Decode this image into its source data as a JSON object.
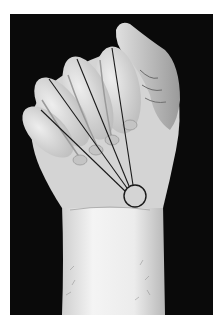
{
  "image": {
    "subject": "clenched fist with lines converging on wrist",
    "style": "black-and-white photograph",
    "background_color": "#0a0a0a",
    "page_color": "#ffffff",
    "skin_color": "#d8d8d8",
    "line_color": "#1a1a1a"
  },
  "annotations": {
    "lines": [
      {
        "name": "little-finger-line",
        "x1": 41,
        "y1": 110,
        "x2": 125,
        "y2": 191
      },
      {
        "name": "ring-finger-line",
        "x1": 49,
        "y1": 79,
        "x2": 127,
        "y2": 188
      },
      {
        "name": "middle-finger-line",
        "x1": 77,
        "y1": 59,
        "x2": 129,
        "y2": 186
      },
      {
        "name": "index-finger-line",
        "x1": 112,
        "y1": 48,
        "x2": 133,
        "y2": 185
      }
    ],
    "circle": {
      "cx": 135,
      "cy": 196,
      "r": 11
    }
  }
}
